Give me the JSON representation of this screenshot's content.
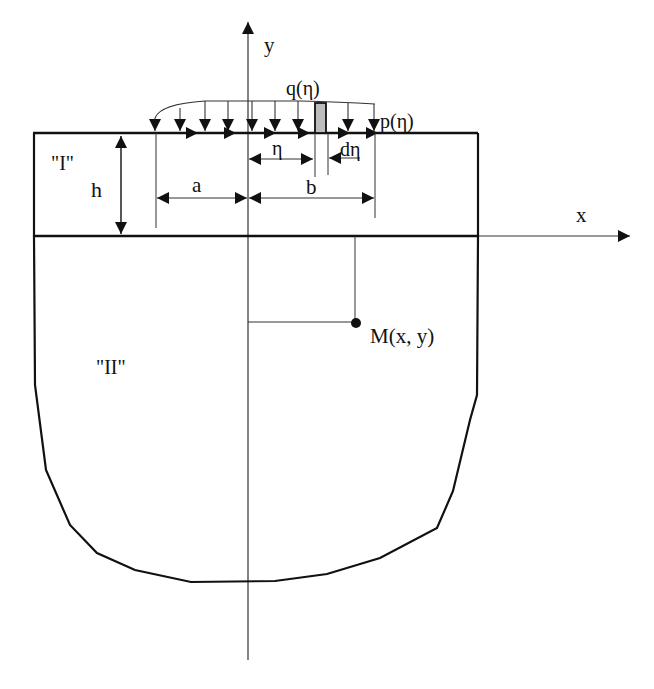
{
  "diagram": {
    "type": "elastic half-space with surface layer under distributed load",
    "colors": {
      "stroke": "#111111",
      "thin_stroke": "#333333",
      "strip_fill": "#bdbdbd",
      "background": "#ffffff"
    },
    "axes": {
      "x_label": "x",
      "y_label": "y"
    },
    "regions": {
      "layer_label": "\"I\"",
      "substrate_label": "\"II\""
    },
    "loads": {
      "normal_load_label": "q(η)",
      "tangential_load_label": "p(η)"
    },
    "dimensions": {
      "thickness_label": "h",
      "left_extent_label": "a",
      "right_extent_label": "b",
      "position_label": "η",
      "strip_width_label": "dη"
    },
    "point": {
      "label": "M(x, y)"
    }
  }
}
